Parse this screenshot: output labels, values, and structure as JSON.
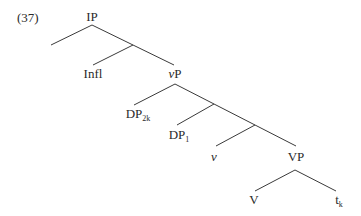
{
  "example_number": "(37)",
  "tree": {
    "nodes": {
      "ip": {
        "text": "IP",
        "sub": ""
      },
      "infl": {
        "text": "Infl",
        "sub": ""
      },
      "vp_light": {
        "text_italic": "v",
        "text": "P",
        "sub": ""
      },
      "dp2k": {
        "text": "DP",
        "sub": "2k"
      },
      "dp1": {
        "text": "DP",
        "sub": "1"
      },
      "v_light": {
        "text_italic": "v",
        "sub": ""
      },
      "vp": {
        "text": "VP",
        "sub": ""
      },
      "v": {
        "text": "V",
        "sub": ""
      },
      "trace": {
        "text": "t",
        "sub": "k"
      }
    },
    "edges": [
      {
        "from": "IP",
        "to": "empty-left"
      },
      {
        "from": "IP",
        "to": "vP (via I')"
      },
      {
        "from": "I'",
        "to": "Infl"
      },
      {
        "from": "vP",
        "to": "DP2k"
      },
      {
        "from": "vP",
        "to": "VP (via v' nodes)"
      },
      {
        "from": "v'",
        "to": "DP1"
      },
      {
        "from": "v''",
        "to": "v"
      },
      {
        "from": "VP",
        "to": "V"
      },
      {
        "from": "VP",
        "to": "tk"
      }
    ]
  }
}
